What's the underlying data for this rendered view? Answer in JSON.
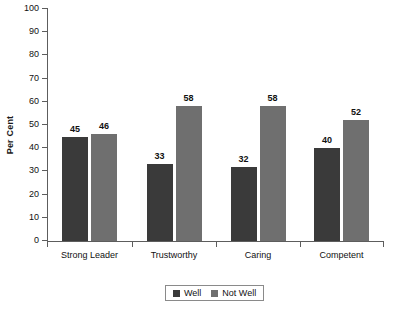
{
  "chart_data": {
    "type": "bar",
    "title": "",
    "xlabel": "",
    "ylabel": "Per Cent",
    "ylim": [
      0,
      100
    ],
    "ytick_step": 10,
    "yticks": [
      0,
      10,
      20,
      30,
      40,
      50,
      60,
      70,
      80,
      90,
      100
    ],
    "grid": false,
    "legend_position": "bottom-center",
    "categories": [
      "Strong Leader",
      "Trustworthy",
      "Caring",
      "Competent"
    ],
    "series": [
      {
        "name": "Well",
        "color": "#3a3a3a",
        "values": [
          45,
          33,
          32,
          40
        ]
      },
      {
        "name": "Not Well",
        "color": "#6f6f6f",
        "values": [
          46,
          58,
          58,
          52
        ]
      }
    ],
    "value_labels": {
      "Strong Leader": {
        "Well": "45",
        "Not Well": "46"
      },
      "Trustworthy": {
        "Well": "33",
        "Not Well": "58"
      },
      "Caring": {
        "Well": "32",
        "Not Well": "58"
      },
      "Competent": {
        "Well": "40",
        "Not Well": "52"
      }
    }
  },
  "axis": {
    "y_title": "Per Cent",
    "y_tick_labels": [
      "100",
      "90",
      "80",
      "70",
      "60",
      "50",
      "40",
      "30",
      "20",
      "10",
      "0"
    ],
    "x_tick_labels": [
      "Strong Leader",
      "Trustworthy",
      "Caring",
      "Competent"
    ]
  },
  "legend": {
    "items": [
      {
        "label": "Well",
        "color": "#3a3a3a"
      },
      {
        "label": "Not Well",
        "color": "#6f6f6f"
      }
    ]
  },
  "colors": {
    "well": "#3a3a3a",
    "not_well": "#6f6f6f",
    "axis": "#5d5d5d",
    "text": "#111111",
    "background": "#ffffff"
  }
}
